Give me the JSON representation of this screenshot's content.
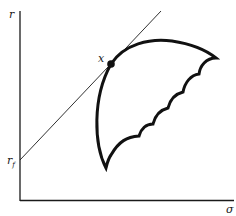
{
  "diagram": {
    "type": "efficient-frontier-tangency",
    "axes": {
      "y_label": "r",
      "x_label": "σ"
    },
    "intercept_label": {
      "main": "r",
      "sub": "f"
    },
    "tangent_point_label": "x",
    "colors": {
      "ink": "#1a1a1a",
      "background": "#ffffff"
    }
  }
}
